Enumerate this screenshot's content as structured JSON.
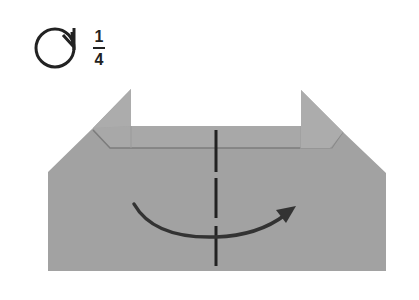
{
  "symbol": {
    "icon": "turn-over-rotate-icon",
    "fraction": {
      "numerator": "1",
      "denominator": "4"
    }
  },
  "colors": {
    "paper": "#a2a2a2",
    "paper_edge": "#8e8e8e",
    "crease": "#7a7a7a",
    "ink": "#333333",
    "background": "#ffffff"
  },
  "diagram": {
    "shape": "folded-paper-with-raised-corners",
    "fold_line": "valley-fold-dashed-vertical-center",
    "arrow": "curved-fold-arrow-left-to-right"
  }
}
